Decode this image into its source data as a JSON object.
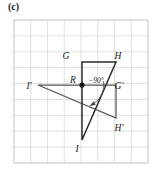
{
  "figure": {
    "panel_label": "(c)",
    "type": "geometry-rotation-diagram",
    "colors": {
      "grid_line": "#d9d9d9",
      "grid_border": "#cfcfcf",
      "shape_stroke": "#2b2b2b",
      "secondary_stroke": "#555555",
      "label_text": "#1a1a1a",
      "background": "#ffffff"
    },
    "grid": {
      "columns": 8,
      "rows": 9,
      "cell_size": 16.7,
      "x0": 14,
      "y0": 20,
      "x1": 148,
      "y1": 163,
      "visible": true
    },
    "center_of_rotation": {
      "label": "R",
      "x": 82,
      "y": 85,
      "marker": "filled-dot"
    },
    "rotation": {
      "angle_label": "−90°",
      "degrees": -90,
      "direction": "clockwise"
    },
    "preimage": {
      "name": "triangle-GHI",
      "vertices": [
        {
          "label": "G",
          "x": 82,
          "y": 62
        },
        {
          "label": "H",
          "x": 116,
          "y": 62
        },
        {
          "label": "I",
          "x": 82,
          "y": 140
        }
      ],
      "label_positions": [
        {
          "label": "G",
          "x": 66,
          "y": 59
        },
        {
          "label": "H",
          "x": 118,
          "y": 59
        },
        {
          "label": "I",
          "x": 77,
          "y": 152
        }
      ]
    },
    "image": {
      "name": "triangle-I-prime-G-prime-H-prime",
      "vertices": [
        {
          "label": "I′",
          "x": 38,
          "y": 85
        },
        {
          "label": "G′",
          "x": 116,
          "y": 85
        },
        {
          "label": "H′",
          "x": 116,
          "y": 118
        }
      ],
      "label_positions": [
        {
          "label": "I′",
          "x": 29,
          "y": 89
        },
        {
          "label": "G′",
          "x": 119,
          "y": 89
        },
        {
          "label": "H′",
          "x": 119,
          "y": 131
        }
      ]
    },
    "arc": {
      "description": "rotation direction arc from R",
      "radius": 22
    }
  }
}
